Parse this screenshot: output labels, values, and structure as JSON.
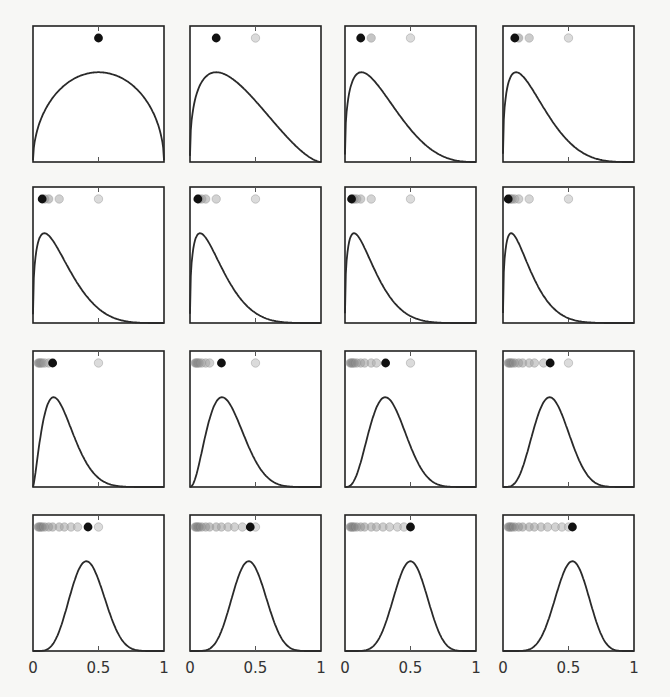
{
  "chart_data": {
    "type": "line",
    "title": "",
    "layout": {
      "rows": 4,
      "cols": 4,
      "grid": false,
      "legend": "none"
    },
    "xlabel": "",
    "ylabel": "",
    "xlim": [
      0,
      1
    ],
    "x_ticks": [
      0,
      0.5,
      1
    ],
    "x_tick_labels": [
      "0",
      "0.5",
      "1"
    ],
    "colors": {
      "curve": "#2a2a2a",
      "current_dot": "#111111",
      "past_dot": "#b8b8b8",
      "frame": "#222222"
    },
    "panels": [
      {
        "index": 1,
        "curve_shape": "arch",
        "peak_x": 0.5,
        "alpha": 1.5,
        "beta": 1.5,
        "dots": [
          0.5
        ],
        "current": 0.5
      },
      {
        "index": 2,
        "curve_shape": "skew",
        "peak_x": 0.2,
        "alpha": 1.4,
        "beta": 2.6,
        "dots": [
          0.2,
          0.5
        ],
        "current": 0.2
      },
      {
        "index": 3,
        "curve_shape": "skew",
        "peak_x": 0.12,
        "alpha": 1.4,
        "beta": 3.8,
        "dots": [
          0.12,
          0.2,
          0.5
        ],
        "current": 0.12
      },
      {
        "index": 4,
        "curve_shape": "skew",
        "peak_x": 0.09,
        "alpha": 1.4,
        "beta": 4.6,
        "dots": [
          0.09,
          0.12,
          0.2,
          0.5
        ],
        "current": 0.09
      },
      {
        "index": 5,
        "curve_shape": "skew",
        "peak_x": 0.08,
        "alpha": 1.4,
        "beta": 5.2,
        "dots": [
          0.07,
          0.09,
          0.12,
          0.2,
          0.5
        ],
        "current": 0.07
      },
      {
        "index": 6,
        "curve_shape": "skew",
        "peak_x": 0.07,
        "alpha": 1.4,
        "beta": 5.8,
        "dots": [
          0.06,
          0.07,
          0.09,
          0.12,
          0.2,
          0.5
        ],
        "current": 0.06
      },
      {
        "index": 7,
        "curve_shape": "skew",
        "peak_x": 0.06,
        "alpha": 1.4,
        "beta": 6.4,
        "dots": [
          0.05,
          0.06,
          0.07,
          0.09,
          0.12,
          0.2,
          0.5
        ],
        "current": 0.05
      },
      {
        "index": 8,
        "curve_shape": "skew",
        "peak_x": 0.05,
        "alpha": 1.4,
        "beta": 7.0,
        "dots": [
          0.04,
          0.05,
          0.06,
          0.07,
          0.09,
          0.12,
          0.2,
          0.5
        ],
        "current": 0.04
      },
      {
        "index": 9,
        "curve_shape": "skew",
        "peak_x": 0.15,
        "alpha": 2.4,
        "beta": 8.5,
        "dots": [
          0.04,
          0.05,
          0.06,
          0.07,
          0.09,
          0.12,
          0.15,
          0.5
        ],
        "current": 0.15
      },
      {
        "index": 10,
        "curve_shape": "skew",
        "peak_x": 0.24,
        "alpha": 3.2,
        "beta": 7.8,
        "dots": [
          0.04,
          0.05,
          0.06,
          0.07,
          0.09,
          0.12,
          0.15,
          0.24,
          0.5
        ],
        "current": 0.24
      },
      {
        "index": 11,
        "curve_shape": "bell",
        "peak_x": 0.31,
        "alpha": 4.2,
        "beta": 8.2,
        "dots": [
          0.04,
          0.05,
          0.06,
          0.07,
          0.09,
          0.12,
          0.15,
          0.2,
          0.24,
          0.31,
          0.5
        ],
        "current": 0.31
      },
      {
        "index": 12,
        "curve_shape": "bell",
        "peak_x": 0.36,
        "alpha": 5.2,
        "beta": 8.6,
        "dots": [
          0.04,
          0.05,
          0.06,
          0.07,
          0.09,
          0.12,
          0.15,
          0.2,
          0.24,
          0.31,
          0.36,
          0.5
        ],
        "current": 0.36
      },
      {
        "index": 13,
        "curve_shape": "bell",
        "peak_x": 0.42,
        "alpha": 6.5,
        "beta": 9.0,
        "dots": [
          0.04,
          0.05,
          0.06,
          0.07,
          0.09,
          0.12,
          0.15,
          0.2,
          0.24,
          0.29,
          0.34,
          0.42,
          0.5
        ],
        "current": 0.42
      },
      {
        "index": 14,
        "curve_shape": "bell",
        "peak_x": 0.46,
        "alpha": 7.5,
        "beta": 9.0,
        "dots": [
          0.04,
          0.05,
          0.06,
          0.07,
          0.09,
          0.12,
          0.15,
          0.2,
          0.24,
          0.29,
          0.34,
          0.4,
          0.46,
          0.5
        ],
        "current": 0.46
      },
      {
        "index": 15,
        "curve_shape": "bell",
        "peak_x": 0.5,
        "alpha": 8.5,
        "beta": 8.5,
        "dots": [
          0.04,
          0.05,
          0.06,
          0.07,
          0.09,
          0.12,
          0.15,
          0.2,
          0.24,
          0.29,
          0.34,
          0.4,
          0.45,
          0.5
        ],
        "current": 0.5
      },
      {
        "index": 16,
        "curve_shape": "bell",
        "peak_x": 0.53,
        "alpha": 9.0,
        "beta": 8.1,
        "dots": [
          0.04,
          0.05,
          0.06,
          0.07,
          0.09,
          0.12,
          0.15,
          0.2,
          0.24,
          0.29,
          0.34,
          0.4,
          0.45,
          0.5,
          0.53
        ],
        "current": 0.53
      }
    ]
  }
}
